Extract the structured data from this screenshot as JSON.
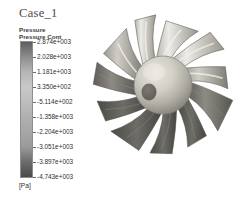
{
  "window": {
    "background_color": "#ffffff",
    "width": 242,
    "height": 198
  },
  "title": {
    "text": "Case_1"
  },
  "legend": {
    "header_line1": "Pressure",
    "header_line2": "Pressure Cont",
    "unit": "[Pa]",
    "orientation": "vertical",
    "colormap": "grayscale",
    "border_color": "#8e8e8e",
    "labels": [
      "2.874e+003",
      "2.028e+003",
      "1.181e+003",
      "3.350e+002",
      "-5.114e+002",
      "-1.358e+003",
      "-2.204e+003",
      "-3.051e+003",
      "-3.897e+003",
      "-4.743e+003"
    ]
  },
  "chart_data": {
    "type": "heatmap",
    "title": "Case_1",
    "subtitle": "Pressure Contour",
    "variable": "Pressure",
    "units": "Pa",
    "colormap": "grayscale",
    "colorbar_orientation": "vertical",
    "colorbar_min": -4743,
    "colorbar_max": 2874,
    "tick_values": [
      2874,
      2028,
      1181,
      335,
      -511.4,
      -1358,
      -2204,
      -3051,
      -3897,
      -4743
    ],
    "tick_labels": [
      "2.874e+003",
      "2.028e+003",
      "1.181e+003",
      "3.350e+002",
      "-5.114e+002",
      "-1.358e+003",
      "-2.204e+003",
      "-3.051e+003",
      "-3.897e+003",
      "-4.743e+003"
    ],
    "colorbar_stops": [
      {
        "value": 2874,
        "color": "#5d5d5d"
      },
      {
        "value": 2028,
        "color": "#8d8d8d"
      },
      {
        "value": 1181,
        "color": "#b5b5b5"
      },
      {
        "value": 335,
        "color": "#c8c8c8"
      },
      {
        "value": -511,
        "color": "#bdbdbd"
      },
      {
        "value": -1358,
        "color": "#b0b0b0"
      },
      {
        "value": -2204,
        "color": "#a6a6a6"
      },
      {
        "value": -3051,
        "color": "#9a9a9a"
      },
      {
        "value": -3897,
        "color": "#6b6b6b"
      },
      {
        "value": -4743,
        "color": "#4a4a4a"
      }
    ],
    "legend_position": "left",
    "grid": false,
    "xlabel": "",
    "ylabel": ""
  },
  "render": {
    "object": "axial-impeller",
    "blade_count": 11,
    "hub_shape": "sphere",
    "hub_color": "#d3d0c9",
    "hub_shadow_color": "#7f7c74",
    "blade_light_color": "#d8d6cf",
    "blade_mid_color": "#a9a7a0",
    "blade_dark_color": "#6e6c66",
    "outline_color": "#5a5852",
    "view": "front-perspective"
  }
}
